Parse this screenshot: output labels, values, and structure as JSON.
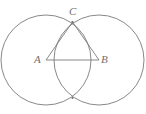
{
  "figure": {
    "type": "geometry-diagram",
    "canvas": {
      "width": 146,
      "height": 114,
      "background": "#ffffff"
    },
    "style": {
      "stroke_color": "#7a7a7a",
      "stroke_width": 0.9,
      "label_color": "#6f6f6f",
      "fill": "none"
    },
    "points": [
      {
        "id": "A",
        "label": "A",
        "x": 46,
        "y": 60,
        "role": "center-of-left-circle"
      },
      {
        "id": "B",
        "label": "B",
        "x": 99,
        "y": 60,
        "role": "center-of-right-circle"
      },
      {
        "id": "C",
        "label": "C",
        "x": 72.5,
        "y": 22,
        "role": "upper-intersection-of-circles"
      },
      {
        "id": "D",
        "label": "",
        "x": 72.5,
        "y": 98,
        "role": "lower-intersection-of-circles"
      }
    ],
    "circles": [
      {
        "id": "circle-A",
        "center": "A",
        "cx": 46,
        "cy": 60,
        "r": 45
      },
      {
        "id": "circle-B",
        "center": "B",
        "cx": 99,
        "cy": 60,
        "r": 45
      }
    ],
    "segments": [
      {
        "id": "segment-AB",
        "from": "A",
        "to": "B",
        "x1": 46,
        "y1": 60,
        "x2": 99,
        "y2": 60
      },
      {
        "id": "segment-AC",
        "from": "A",
        "to": "C",
        "x1": 46,
        "y1": 60,
        "x2": 72.5,
        "y2": 22
      },
      {
        "id": "segment-BC",
        "from": "B",
        "to": "C",
        "x1": 99,
        "y1": 60,
        "x2": 72.5,
        "y2": 22
      }
    ],
    "labels": {
      "A": "A",
      "B": "B",
      "C": "C"
    }
  }
}
